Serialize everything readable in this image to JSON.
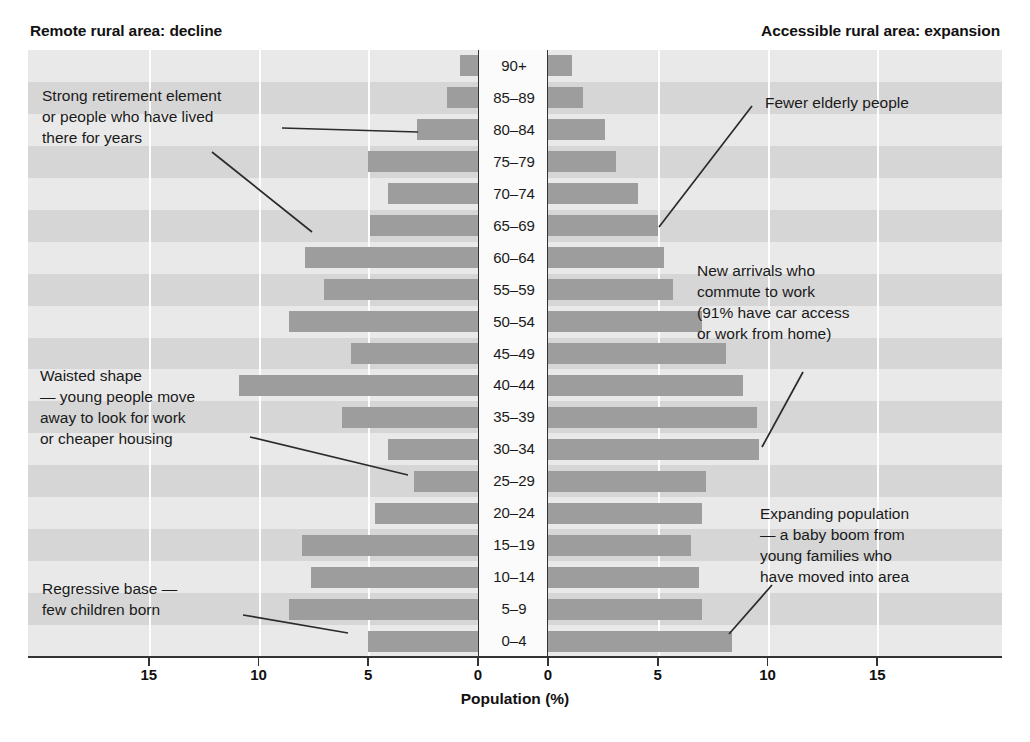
{
  "titles": {
    "left": "Remote rural area: decline",
    "right": "Accessible rural area: expansion"
  },
  "axis": {
    "caption": "Population (%)",
    "left_ticks": [
      "15",
      "10",
      "5",
      "0"
    ],
    "right_ticks": [
      "0",
      "5",
      "10",
      "15"
    ]
  },
  "annotations": {
    "retirement": "Strong retirement element\nor people who have lived\nthere for years",
    "waisted": "Waisted shape\n— young people move\naway to look for work\nor cheaper housing",
    "regressive": "Regressive base —\nfew children born",
    "elderly": "Fewer elderly people",
    "commute": "New arrivals who\ncommute to work\n(91% have car access\nor work from home)",
    "expanding": "Expanding population\n— a baby boom from\nyoung families who\nhave moved into area"
  },
  "colors": {
    "bar": "#9d9d9d",
    "band_light": "#e9e9e9",
    "band_dark": "#d6d6d6",
    "axis": "#333333",
    "text": "#1a1a1a"
  },
  "chart_data": {
    "type": "bar",
    "xlabel": "Population (%)",
    "ylabel": "Age group",
    "xlim": [
      0,
      19
    ],
    "tick_values": [
      0,
      5,
      10,
      15
    ],
    "grid": true,
    "legend_position": "none",
    "orientation": "horizontal-pyramid",
    "categories": [
      "90+",
      "85–89",
      "80–84",
      "75–79",
      "70–74",
      "65–69",
      "60–64",
      "55–59",
      "50–54",
      "45–49",
      "40–44",
      "35–39",
      "30–34",
      "25–29",
      "20–24",
      "15–19",
      "10–14",
      "5–9",
      "0–4"
    ],
    "series": [
      {
        "name": "Remote rural area: decline",
        "side": "left",
        "values": [
          0.8,
          1.4,
          2.8,
          5.0,
          4.1,
          4.9,
          7.9,
          7.0,
          8.6,
          5.8,
          10.9,
          6.2,
          4.1,
          2.9,
          4.7,
          8.0,
          7.6,
          8.6,
          5.0
        ]
      },
      {
        "name": "Accessible rural area: expansion",
        "side": "right",
        "values": [
          1.1,
          1.6,
          2.6,
          3.1,
          4.1,
          5.0,
          5.3,
          5.7,
          7.0,
          8.1,
          8.9,
          9.5,
          9.6,
          7.2,
          7.0,
          6.5,
          6.9,
          7.0,
          8.4
        ]
      }
    ]
  }
}
